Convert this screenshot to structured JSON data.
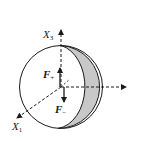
{
  "diagram": {
    "colors": {
      "stroke": "#1a1a1a",
      "crescent_fill": "#c8c8c8",
      "sphere_fill": "#ffffff",
      "background": "#ffffff"
    },
    "axes": [
      {
        "name": "X3",
        "base": "X",
        "subscript": "3",
        "direction": "up"
      },
      {
        "name": "X1",
        "base": "X",
        "subscript": "1",
        "direction": "down-left"
      },
      {
        "name": "X2",
        "base": "",
        "subscript": "",
        "direction": "right",
        "unlabeled": true
      }
    ],
    "forces": [
      {
        "name": "F+",
        "base": "F",
        "subscript": "+",
        "direction": "up"
      },
      {
        "name": "F-",
        "base": "F",
        "subscript": "−",
        "direction": "down"
      }
    ],
    "labels": {
      "x3_base": "X",
      "x3_sub": "3",
      "x1_base": "X",
      "x1_sub": "1",
      "fplus_base": "F",
      "fplus_sub": "+",
      "fminus_base": "F",
      "fminus_sub": "−"
    }
  }
}
